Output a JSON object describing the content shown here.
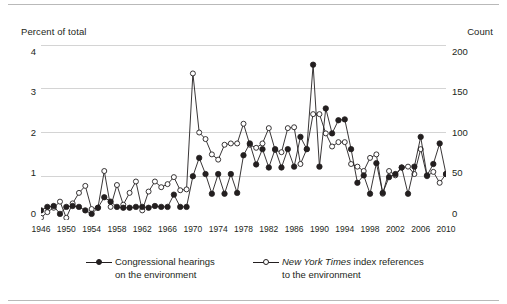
{
  "axes": {
    "left_caption": "Percent of total",
    "right_caption": "Count",
    "left_ticks": [
      "0",
      "1",
      "2",
      "3",
      "4"
    ],
    "right_ticks": [
      "0",
      "50",
      "100",
      "150",
      "200"
    ],
    "x_ticks": [
      "1946",
      "1950",
      "1954",
      "1958",
      "1962",
      "1966",
      "1970",
      "1974",
      "1978",
      "1982",
      "1986",
      "1990",
      "1994",
      "1998",
      "2002",
      "2006",
      "2010"
    ]
  },
  "legend": {
    "hearings_line1": "Congressional hearings",
    "hearings_line2": "on the environment",
    "nyt_italic": "New York Times",
    "nyt_rest": " index references",
    "nyt_line2": "to the environment"
  },
  "colors": {
    "ink": "#231f20",
    "grid": "#d4d4d4",
    "rule": "#b9b9b9",
    "marker_fill_hearings": "#231f20",
    "marker_fill_nyt": "#ffffff"
  },
  "chart_data": {
    "type": "line",
    "title": "",
    "xlabel": "",
    "ylabel": "Percent of total",
    "ylabel_secondary": "Count",
    "xlim": [
      1946,
      2010
    ],
    "ylim": [
      0,
      4
    ],
    "ylim_secondary": [
      0,
      200
    ],
    "grid": true,
    "legend_position": "bottom",
    "x": [
      1946,
      1947,
      1948,
      1949,
      1950,
      1951,
      1952,
      1953,
      1954,
      1955,
      1956,
      1957,
      1958,
      1959,
      1960,
      1961,
      1962,
      1963,
      1964,
      1965,
      1966,
      1967,
      1968,
      1969,
      1970,
      1971,
      1972,
      1973,
      1974,
      1975,
      1976,
      1977,
      1978,
      1979,
      1980,
      1981,
      1982,
      1983,
      1984,
      1985,
      1986,
      1987,
      1988,
      1989,
      1990,
      1991,
      1992,
      1993,
      1994,
      1995,
      1996,
      1997,
      1998,
      1999,
      2000,
      2001,
      2002,
      2003,
      2004,
      2005,
      2006,
      2007,
      2008,
      2009,
      2010
    ],
    "series": [
      {
        "name": "Congressional hearings on the environment",
        "marker": "filled-circle",
        "axis": "left",
        "values": [
          0.22,
          0.3,
          0.32,
          0.14,
          0.3,
          0.32,
          0.3,
          0.22,
          0.14,
          0.28,
          0.52,
          0.42,
          0.3,
          0.28,
          0.28,
          0.3,
          0.3,
          0.28,
          0.32,
          0.3,
          0.3,
          0.58,
          0.3,
          0.3,
          1.0,
          1.42,
          1.05,
          0.6,
          1.05,
          0.6,
          1.05,
          0.62,
          1.48,
          1.75,
          1.27,
          1.62,
          1.2,
          1.62,
          1.2,
          1.62,
          1.22,
          1.9,
          1.62,
          3.55,
          1.22,
          2.55,
          1.98,
          2.28,
          2.3,
          1.62,
          0.85,
          1.02,
          0.6,
          1.3,
          0.62,
          0.98,
          1.05,
          1.2,
          0.6,
          1.22,
          1.9,
          1.02,
          1.28,
          1.75,
          1.05
        ]
      },
      {
        "name": "New York Times index references to the environment",
        "marker": "open-circle",
        "axis": "right",
        "values_left_scale": [
          0.05,
          0.18,
          0.28,
          0.42,
          0.05,
          0.38,
          0.62,
          0.78,
          0.25,
          0.28,
          1.12,
          0.3,
          0.8,
          0.35,
          0.62,
          0.88,
          0.22,
          0.65,
          0.88,
          0.75,
          0.82,
          0.98,
          0.68,
          0.7,
          3.35,
          2.0,
          1.85,
          1.5,
          1.38,
          1.72,
          1.75,
          1.75,
          2.2,
          1.72,
          1.65,
          1.75,
          2.1,
          1.6,
          1.55,
          2.1,
          2.12,
          1.28,
          1.62,
          2.42,
          2.42,
          1.98,
          1.68,
          1.78,
          1.78,
          1.28,
          1.22,
          1.12,
          1.42,
          1.5,
          0.6,
          1.12,
          1.02,
          1.2,
          1.22,
          1.05,
          1.62,
          1.0,
          1.1,
          0.85,
          1.05
        ],
        "values_count_scale": [
          2,
          9,
          14,
          21,
          2,
          19,
          31,
          39,
          12,
          14,
          56,
          15,
          40,
          17,
          31,
          44,
          11,
          32,
          44,
          38,
          41,
          49,
          34,
          35,
          168,
          100,
          92,
          75,
          69,
          86,
          88,
          88,
          110,
          86,
          82,
          88,
          105,
          80,
          78,
          105,
          106,
          64,
          81,
          121,
          121,
          99,
          84,
          89,
          89,
          64,
          61,
          56,
          71,
          75,
          30,
          56,
          51,
          60,
          61,
          52,
          81,
          50,
          55,
          42,
          52
        ]
      }
    ]
  }
}
